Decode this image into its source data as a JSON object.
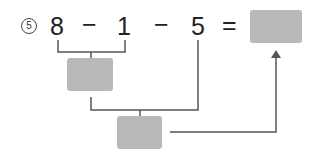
{
  "problem": {
    "number": "5",
    "terms": [
      "8",
      "−",
      "1",
      "−",
      "5",
      "="
    ],
    "answer_box": "",
    "intermediate_box": "",
    "second_box": ""
  },
  "colors": {
    "box": "#b9b9b9",
    "line": "#555555"
  }
}
